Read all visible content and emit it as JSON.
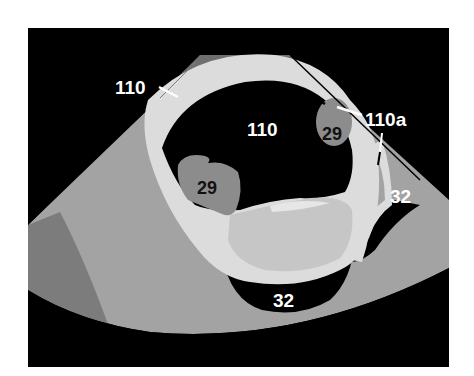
{
  "diagram": {
    "type": "schematic ultrasound cross-section",
    "colors": {
      "background": "#ffffff",
      "frame": "#000000",
      "fan_tissue": "#a3a3a3",
      "fan_tissue_dark": "#7c7c7c",
      "top_cap": "#6f6f6f",
      "wall": "#dcdcdc",
      "inner_tissue": "#c6c6c6",
      "lesion": "#8c8c8c",
      "label_light": "#ffffff",
      "label_dark": "#111111"
    },
    "labels": [
      {
        "id": "label-110-outer",
        "text": "110",
        "color": "light",
        "has_leader": true
      },
      {
        "id": "label-110-inner",
        "text": "110",
        "color": "light",
        "has_leader": false
      },
      {
        "id": "label-110a",
        "text": "110a",
        "color": "light",
        "has_leader": true
      },
      {
        "id": "label-29-right",
        "text": "29",
        "color": "dark",
        "has_leader": false
      },
      {
        "id": "label-29-left",
        "text": "29",
        "color": "dark",
        "has_leader": false
      },
      {
        "id": "label-32-right",
        "text": "32",
        "color": "light",
        "has_leader": false
      },
      {
        "id": "label-32-bottom",
        "text": "32",
        "color": "light",
        "has_leader": false
      }
    ]
  }
}
